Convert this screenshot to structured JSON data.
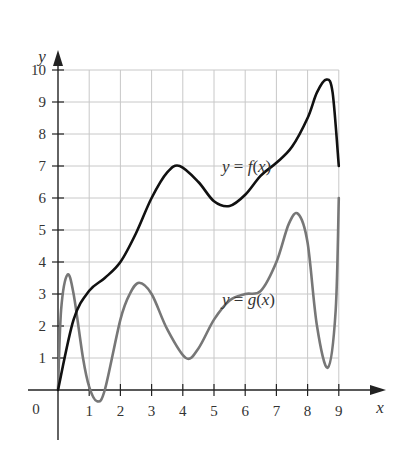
{
  "chart_data": {
    "type": "line",
    "title": "",
    "xlabel": "x",
    "ylabel": "y",
    "xlim": [
      0,
      9
    ],
    "ylim": [
      0,
      10
    ],
    "grid": true,
    "x_ticks": [
      "1",
      "2",
      "3",
      "4",
      "5",
      "6",
      "7",
      "8",
      "9"
    ],
    "y_ticks": [
      "1",
      "2",
      "3",
      "4",
      "5",
      "6",
      "7",
      "8",
      "9",
      "10"
    ],
    "origin_label": "0",
    "series": [
      {
        "name": "y = f(x)",
        "label_parts": {
          "lhs": "y",
          "eq": " = ",
          "fn": "f",
          "arg": "(x)"
        },
        "color": "#111111",
        "points": [
          [
            0,
            0
          ],
          [
            0.5,
            2.2
          ],
          [
            1,
            3.1
          ],
          [
            1.5,
            3.5
          ],
          [
            2,
            4
          ],
          [
            2.5,
            4.9
          ],
          [
            3,
            6
          ],
          [
            3.5,
            6.8
          ],
          [
            3.9,
            7
          ],
          [
            4.5,
            6.5
          ],
          [
            5,
            5.9
          ],
          [
            5.5,
            5.75
          ],
          [
            6,
            6.1
          ],
          [
            6.5,
            6.7
          ],
          [
            7,
            7.1
          ],
          [
            7.5,
            7.6
          ],
          [
            8,
            8.5
          ],
          [
            8.3,
            9.3
          ],
          [
            8.6,
            9.7
          ],
          [
            8.8,
            9.3
          ],
          [
            9,
            7
          ]
        ]
      },
      {
        "name": "y = g(x)",
        "label_parts": {
          "lhs": "y",
          "eq": " = ",
          "fn": "g",
          "arg": "(x)"
        },
        "color": "#777777",
        "points": [
          [
            0,
            0
          ],
          [
            0.1,
            2.5
          ],
          [
            0.3,
            3.6
          ],
          [
            0.5,
            3
          ],
          [
            0.8,
            1
          ],
          [
            1,
            0.1
          ],
          [
            1.25,
            -0.35
          ],
          [
            1.5,
            0
          ],
          [
            2,
            2.2
          ],
          [
            2.3,
            3
          ],
          [
            2.6,
            3.35
          ],
          [
            3,
            3
          ],
          [
            3.5,
            1.9
          ],
          [
            4.1,
            1
          ],
          [
            4.5,
            1.3
          ],
          [
            5,
            2.2
          ],
          [
            5.5,
            2.8
          ],
          [
            6,
            3
          ],
          [
            6.5,
            3.1
          ],
          [
            7,
            4
          ],
          [
            7.4,
            5.2
          ],
          [
            7.7,
            5.5
          ],
          [
            8,
            4.6
          ],
          [
            8.3,
            2
          ],
          [
            8.65,
            0.7
          ],
          [
            8.9,
            2.5
          ],
          [
            9,
            6
          ]
        ]
      }
    ]
  }
}
